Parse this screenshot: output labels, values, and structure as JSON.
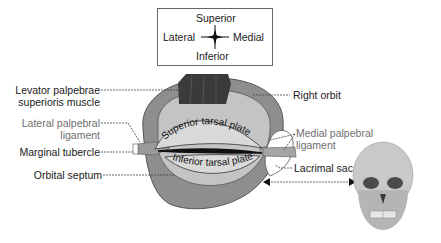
{
  "orientation": {
    "superior": "Superior",
    "inferior": "Inferior",
    "lateral": "Lateral",
    "medial": "Medial"
  },
  "labels_left": [
    {
      "line1": "Levator palpebrae",
      "line2": "superioris muscle"
    },
    {
      "line1": "Lateral palpebral",
      "line2": "ligament"
    },
    {
      "line1": "Marginal tubercle"
    },
    {
      "line1": "Orbital septum"
    }
  ],
  "labels_right": [
    {
      "line1": "Right orbit"
    },
    {
      "line1": "Medial palpebral",
      "line2": "ligament"
    },
    {
      "line1": "Lacrimal sac"
    }
  ],
  "plates": {
    "superior": "Superior tarsal plate",
    "inferior": "Inferior tarsal plate"
  },
  "colors": {
    "orbit_outer": "#8a8a8a",
    "septum": "#c4c4c4",
    "plate": "#d9d9d9",
    "muscle": "#3a3a3a",
    "grey_label": "#6e6e6e"
  }
}
